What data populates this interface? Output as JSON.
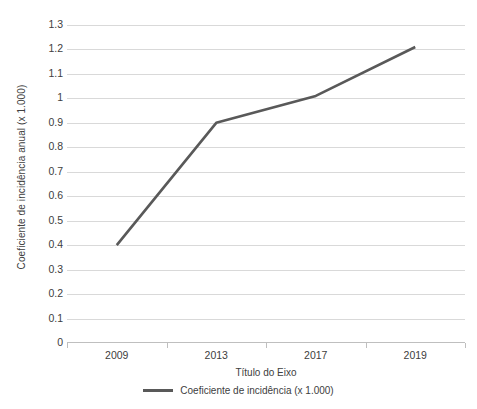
{
  "chart_data": {
    "type": "line",
    "title": "",
    "xlabel": "Título do Eixo",
    "ylabel": "Coeficiente de incidência anual  (x 1.000)",
    "categories": [
      "2009",
      "2013",
      "2017",
      "2019"
    ],
    "series": [
      {
        "name": "Coeficiente de incidência (x 1.000)",
        "values": [
          0.4,
          0.9,
          1.01,
          1.21
        ],
        "color": "#595959"
      }
    ],
    "ylim": [
      0,
      1.3
    ],
    "ytick_step": 0.1,
    "ytick_labels": [
      "1.3",
      "1.2",
      "1.1",
      "1",
      "0.9",
      "0.8",
      "0.7",
      "0.6",
      "0.5",
      "0.4",
      "0.3",
      "0.2",
      "0.1",
      "0"
    ],
    "ytick_values": [
      1.3,
      1.2,
      1.1,
      1.0,
      0.9,
      0.8,
      0.7,
      0.6,
      0.5,
      0.4,
      0.3,
      0.2,
      0.1,
      0
    ],
    "grid": true,
    "grid_axis": "y",
    "grid_color": "#d9d9d9",
    "axis_color": "#bfbfbf",
    "text_color": "#404040",
    "background": "#ffffff",
    "legend_position": "bottom",
    "legend_entries": [
      "Coeficiente de incidência (x 1.000)"
    ]
  }
}
